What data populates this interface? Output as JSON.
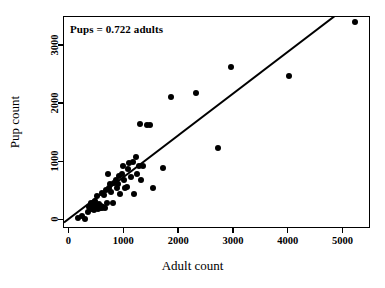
{
  "chart_data": {
    "type": "scatter",
    "title": "",
    "xlabel": "Adult count",
    "ylabel": "Pup count",
    "xlim": [
      -100,
      5500
    ],
    "ylim": [
      -150,
      3500
    ],
    "xticks": [
      0,
      1000,
      2000,
      3000,
      4000,
      5000
    ],
    "yticks": [
      0,
      1000,
      2000,
      3000
    ],
    "xticklabels": [
      "0",
      "1000",
      "2000",
      "3000",
      "4000",
      "5000"
    ],
    "yticklabels": [
      "0",
      "1000",
      "2000",
      "3000"
    ],
    "grid": false,
    "legend": null,
    "annotations": [
      {
        "text": "Pups = 0.722 adults",
        "x": 250,
        "y": 3280
      }
    ],
    "marker": {
      "shape": "circle",
      "color": "#000000",
      "size": 6
    },
    "fit_line": {
      "label": "Pups = 0.722 adults",
      "type": "linear-through-origin",
      "slope": 0.722,
      "intercept": 0,
      "color": "#000000",
      "x_start": -100,
      "x_end": 5030
    },
    "points": [
      {
        "x": 150,
        "y": 40
      },
      {
        "x": 230,
        "y": 80
      },
      {
        "x": 290,
        "y": 20
      },
      {
        "x": 330,
        "y": 150
      },
      {
        "x": 360,
        "y": 230
      },
      {
        "x": 390,
        "y": 200
      },
      {
        "x": 400,
        "y": 300
      },
      {
        "x": 430,
        "y": 260
      },
      {
        "x": 450,
        "y": 180
      },
      {
        "x": 470,
        "y": 330
      },
      {
        "x": 490,
        "y": 240
      },
      {
        "x": 500,
        "y": 420
      },
      {
        "x": 520,
        "y": 200
      },
      {
        "x": 540,
        "y": 230
      },
      {
        "x": 545,
        "y": 280
      },
      {
        "x": 560,
        "y": 215
      },
      {
        "x": 575,
        "y": 250
      },
      {
        "x": 585,
        "y": 205
      },
      {
        "x": 600,
        "y": 470
      },
      {
        "x": 610,
        "y": 230
      },
      {
        "x": 630,
        "y": 440
      },
      {
        "x": 650,
        "y": 215
      },
      {
        "x": 660,
        "y": 530
      },
      {
        "x": 680,
        "y": 300
      },
      {
        "x": 700,
        "y": 800
      },
      {
        "x": 720,
        "y": 560
      },
      {
        "x": 740,
        "y": 620
      },
      {
        "x": 760,
        "y": 480
      },
      {
        "x": 790,
        "y": 300
      },
      {
        "x": 810,
        "y": 640
      },
      {
        "x": 840,
        "y": 700
      },
      {
        "x": 860,
        "y": 560
      },
      {
        "x": 880,
        "y": 620
      },
      {
        "x": 900,
        "y": 760
      },
      {
        "x": 920,
        "y": 450
      },
      {
        "x": 950,
        "y": 790
      },
      {
        "x": 980,
        "y": 930
      },
      {
        "x": 1000,
        "y": 700
      },
      {
        "x": 1020,
        "y": 560
      },
      {
        "x": 1050,
        "y": 565
      },
      {
        "x": 1070,
        "y": 880
      },
      {
        "x": 1090,
        "y": 990
      },
      {
        "x": 1120,
        "y": 750
      },
      {
        "x": 1150,
        "y": 1000
      },
      {
        "x": 1180,
        "y": 450
      },
      {
        "x": 1210,
        "y": 1090
      },
      {
        "x": 1240,
        "y": 800
      },
      {
        "x": 1270,
        "y": 940
      },
      {
        "x": 1290,
        "y": 1650
      },
      {
        "x": 1300,
        "y": 690
      },
      {
        "x": 1340,
        "y": 930
      },
      {
        "x": 1420,
        "y": 1640
      },
      {
        "x": 1470,
        "y": 1640
      },
      {
        "x": 1520,
        "y": 560
      },
      {
        "x": 1700,
        "y": 900
      },
      {
        "x": 1850,
        "y": 2120
      },
      {
        "x": 2300,
        "y": 2200
      },
      {
        "x": 2700,
        "y": 1250
      },
      {
        "x": 2950,
        "y": 2640
      },
      {
        "x": 4000,
        "y": 2480
      },
      {
        "x": 5200,
        "y": 3410
      }
    ]
  }
}
